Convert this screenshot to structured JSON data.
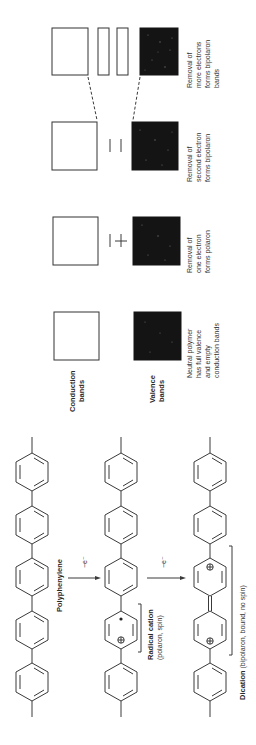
{
  "figure": {
    "band_diagram": {
      "axis_labels": {
        "conduction": "Conduction",
        "conduction_2": "bands",
        "valence": "Valence",
        "valence_2": "bands"
      },
      "stages": [
        {
          "id": "neutral",
          "caption": [
            "Neutral polymer",
            "has full valence",
            "and empty",
            "conduction bands"
          ],
          "midgap_marks": "none"
        },
        {
          "id": "polaron",
          "caption": [
            "Removal of",
            "one electron",
            "forms polaron"
          ],
          "midgap_marks": "one empty level + one half-filled level (+)"
        },
        {
          "id": "bipolaron",
          "caption": [
            "Removal of",
            "second electron",
            "forms bipolaron"
          ],
          "midgap_marks": "two empty levels"
        },
        {
          "id": "bipolaron-bands",
          "caption": [
            "Removal of",
            "more electrons",
            "forms bipolaron",
            "bands"
          ],
          "midgap_marks": "two empty bands"
        }
      ],
      "colors": {
        "filled_band": "#141414",
        "empty_band": "#ffffff",
        "outline": "#333333"
      }
    },
    "chemistry": {
      "arrow_label_1": "−e⁻",
      "arrow_label_2": "−e⁻",
      "polyphenylene": {
        "label": "Polyphenylene"
      },
      "radical_cation": {
        "label_bold": "Radical cation",
        "label_sub": "(polaron, spin)"
      },
      "dication": {
        "label_bold": "Dication",
        "label_sub": " (bipolaron, bound, no spin)"
      },
      "symbols": {
        "plus_circle": "⊕",
        "radical_dot": "•"
      }
    }
  }
}
